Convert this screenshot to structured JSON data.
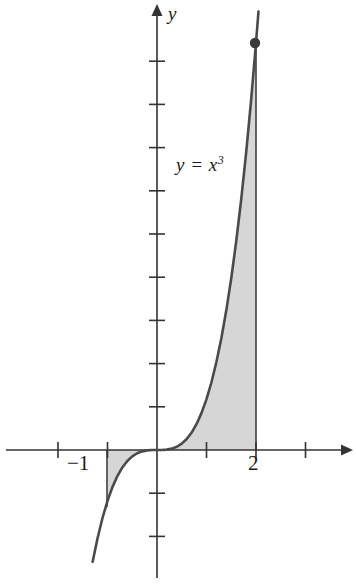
{
  "figure": {
    "title": "",
    "background_color": "#ffffff",
    "width": 356,
    "height": 584
  },
  "labels": {
    "y_axis": "y",
    "curve_equation_base": "y = x",
    "curve_equation_exponent": "3",
    "tick_neg1": "−1",
    "tick_2": "2"
  },
  "colors": {
    "axis": "#333333",
    "curve": "#4a4a4a",
    "shade_fill": "#d6d6d6",
    "shade_stroke": "#9a9a9a",
    "point_marker": "#3a3a3a",
    "text": "#1a1a1a"
  },
  "chart_data": {
    "type": "line",
    "title": "",
    "xlabel": "x",
    "ylabel": "y",
    "function": "y = x^3",
    "grid": false,
    "legend": null,
    "annotations": [
      {
        "text": "y = x^3",
        "x": 0.4,
        "y": 5.7
      },
      {
        "text": "-1",
        "x": -1,
        "y": 0
      },
      {
        "text": "2",
        "x": 2,
        "y": 0
      }
    ],
    "xlim": [
      -2.1,
      4.0
    ],
    "ylim": [
      -2.6,
      10.3
    ],
    "x_ticks": [
      -2,
      -1,
      1,
      2,
      3
    ],
    "x_tick_labels": [
      "",
      "−1",
      "",
      "2",
      ""
    ],
    "y_ticks": [
      -2,
      -1,
      1,
      2,
      3,
      4,
      5,
      6,
      7,
      8,
      9
    ],
    "y_tick_labels": [
      "",
      "",
      "",
      "",
      "",
      "",
      "",
      "",
      "",
      "",
      ""
    ],
    "shaded_region": {
      "description": "Region between y = x^3 and the x-axis from x = -1 to x = 2",
      "x_start": -1,
      "x_end": 2,
      "fill": "#d6d6d6"
    },
    "markers": [
      {
        "x": 2,
        "y": 8,
        "style": "filled-circle"
      }
    ],
    "boundary_lines": [
      {
        "x": -1,
        "from_y": 0,
        "to_y": -1
      },
      {
        "x": 2,
        "from_y": 0,
        "to_y": 8
      }
    ],
    "x": [
      -1.3,
      -1.2,
      -1.1,
      -1.0,
      -0.9,
      -0.8,
      -0.7,
      -0.6,
      -0.5,
      -0.4,
      -0.3,
      -0.2,
      -0.1,
      0.0,
      0.1,
      0.2,
      0.3,
      0.4,
      0.5,
      0.6,
      0.7,
      0.8,
      0.9,
      1.0,
      1.1,
      1.2,
      1.3,
      1.4,
      1.5,
      1.6,
      1.7,
      1.8,
      1.9,
      2.0,
      2.05
    ],
    "y": [
      -2.197,
      -1.728,
      -1.331,
      -1.0,
      -0.729,
      -0.512,
      -0.343,
      -0.216,
      -0.125,
      -0.064,
      -0.027,
      -0.008,
      -0.001,
      0.0,
      0.001,
      0.008,
      0.027,
      0.064,
      0.125,
      0.216,
      0.343,
      0.512,
      0.729,
      1.0,
      1.331,
      1.728,
      2.197,
      2.744,
      3.375,
      4.096,
      4.913,
      5.832,
      6.859,
      8.0,
      8.615
    ]
  }
}
